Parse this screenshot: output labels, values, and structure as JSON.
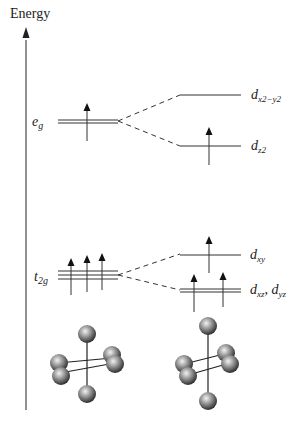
{
  "axis": {
    "label": "Energy"
  },
  "left_levels": {
    "eg": {
      "main": "e",
      "sub": "g",
      "electrons": 1
    },
    "t2g": {
      "main": "t",
      "sub": "2g",
      "electrons": 3
    }
  },
  "right_levels": {
    "dx2y2": {
      "main": "d",
      "sub": "x2−y2",
      "electrons": 0
    },
    "dz2": {
      "main": "d",
      "sub": "z2",
      "electrons": 1
    },
    "dxy": {
      "main": "d",
      "sub": "xy",
      "electrons": 1
    },
    "dxz_dyz": {
      "main1": "d",
      "sub1": "xz",
      "sep": ", ",
      "main2": "d",
      "sub2": "yz",
      "electrons": 2
    }
  },
  "geometries": [
    {
      "name": "octahedral"
    },
    {
      "name": "tetragonally-elongated-octahedral"
    }
  ],
  "colors": {
    "line": "#333333",
    "sphere_light": "#dddddd",
    "sphere_dark": "#333333"
  }
}
